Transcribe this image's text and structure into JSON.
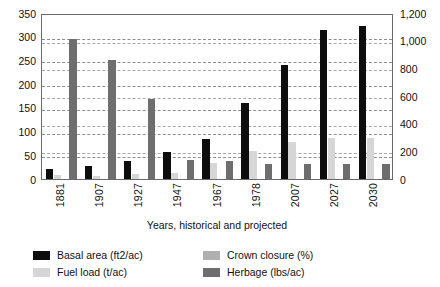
{
  "chart_data": {
    "type": "bar",
    "title": "",
    "xlabel": "Years, historical and projected",
    "ylabel": "",
    "categories": [
      "1881",
      "1907",
      "1927",
      "1947",
      "1967",
      "1978",
      "2007",
      "2027",
      "2030"
    ],
    "axes": {
      "left": {
        "ticks": [
          "0",
          "50",
          "100",
          "150",
          "200",
          "250",
          "300",
          "350"
        ],
        "min": 0,
        "max": 350,
        "step": 50,
        "series": [
          "Basal area (ft2/ac)",
          "Fuel load (t/ac)",
          "Crown closure (%)"
        ]
      },
      "right": {
        "ticks": [
          "0",
          "200",
          "400",
          "600",
          "800",
          "1,000",
          "1,200"
        ],
        "min": 0,
        "max": 1200,
        "step": 200,
        "series": [
          "Herbage (lbs/ac)"
        ]
      }
    },
    "grid": true,
    "legend_position": "bottom",
    "series": [
      {
        "name": "Basal area (ft2/ac)",
        "axis": "left",
        "color": "#0d0d0d",
        "values": [
          22,
          28,
          38,
          58,
          84,
          160,
          240,
          315,
          322
        ]
      },
      {
        "name": "Fuel load (t/ac)",
        "axis": "left",
        "color": "#d6d6d6",
        "values": [
          8,
          7,
          10,
          12,
          34,
          59,
          79,
          87,
          87
        ]
      },
      {
        "name": "Crown closure (%)",
        "axis": "left",
        "color": "#b0b0b0",
        "values": [
          0,
          0,
          0,
          0,
          0,
          0,
          0,
          0,
          0
        ]
      },
      {
        "name": "Herbage (lbs/ac)",
        "axis": "right",
        "color": "#6e6e6e",
        "values": [
          1010,
          860,
          580,
          135,
          130,
          108,
          110,
          112,
          112
        ]
      }
    ]
  },
  "legend": {
    "items": [
      {
        "label": "Basal area (ft2/ac)",
        "color": "#0d0d0d"
      },
      {
        "label": "Crown closure (%)",
        "color": "#b0b0b0"
      },
      {
        "label": "Fuel load (t/ac)",
        "color": "#d6d6d6"
      },
      {
        "label": "Herbage (lbs/ac)",
        "color": "#6e6e6e"
      }
    ]
  }
}
